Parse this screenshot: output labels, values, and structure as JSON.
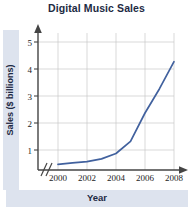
{
  "chart_data": {
    "type": "line",
    "title": "Digital Music Sales",
    "xlabel": "Year",
    "ylabel": "Sales ($ billions)",
    "x": [
      2000,
      2001,
      2002,
      2003,
      2004,
      2005,
      2006,
      2007,
      2008
    ],
    "values": [
      0.1,
      0.15,
      0.2,
      0.3,
      0.5,
      0.95,
      2.0,
      2.9,
      3.9
    ],
    "series": [
      {
        "name": "Digital Music Sales",
        "values": [
          0.1,
          0.15,
          0.2,
          0.3,
          0.5,
          0.95,
          2.0,
          2.9,
          3.9
        ],
        "color": "#41619e"
      }
    ],
    "xtick_labels": [
      "2000",
      "2002",
      "2004",
      "2006",
      "2008"
    ],
    "xtick_values": [
      2000,
      2002,
      2004,
      2006,
      2008
    ],
    "ytick_labels": [
      "1",
      "2",
      "3",
      "4",
      "5"
    ],
    "ytick_values": [
      1,
      2,
      3,
      4,
      5
    ],
    "xlim": [
      2000,
      2008
    ],
    "ylim": [
      0,
      5.5
    ],
    "grid": true,
    "legend": false,
    "axis_break_x": true,
    "line_color": "#41619e",
    "grid_color": "#c9c9c9",
    "axis_color": "#444444",
    "title_color": "#1d2a44",
    "band_color": "#dde3ee"
  },
  "labels": {
    "y_tick_1": "1",
    "y_tick_2": "2",
    "y_tick_3": "3",
    "y_tick_4": "4",
    "y_tick_5": "5",
    "x_tick_2000": "2000",
    "x_tick_2002": "2002",
    "x_tick_2004": "2004",
    "x_tick_2006": "2006",
    "x_tick_2008": "2008"
  }
}
